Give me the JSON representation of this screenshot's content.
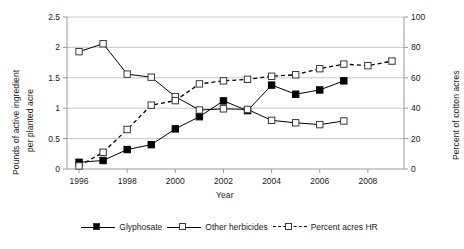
{
  "chart_data": {
    "type": "line",
    "title": "",
    "xlabel": "Year",
    "ylabel": "Pounds of active ingredient per planted acre",
    "ylabel_line1": "Pounds of active ingredient",
    "ylabel_line2": "per planted acre",
    "y2label": "Percent of cotton acres",
    "xlim": [
      1995.5,
      2009.5
    ],
    "ylim": [
      0,
      2.5
    ],
    "y2lim": [
      0,
      100
    ],
    "grid": true,
    "legend_position": "bottom",
    "x": [
      1996,
      1997,
      1998,
      1999,
      2000,
      2001,
      2002,
      2003,
      2004,
      2005,
      2006,
      2007,
      2008,
      2009
    ],
    "xticks": [
      1996,
      1998,
      2000,
      2002,
      2004,
      2006,
      2008
    ],
    "xtick_labels": [
      "1996",
      "1998",
      "2000",
      "2002",
      "2004",
      "2006",
      "2008"
    ],
    "yticks": [
      0,
      0.5,
      1,
      1.5,
      2,
      2.5
    ],
    "ytick_labels": [
      "0",
      "0.5",
      "1",
      "1.5",
      "2",
      "2.5"
    ],
    "y2ticks": [
      0,
      20,
      40,
      60,
      80,
      100
    ],
    "y2tick_labels": [
      "0",
      "20",
      "40",
      "60",
      "80",
      "100"
    ],
    "series": [
      {
        "name": "Glyphosate",
        "axis": "left",
        "marker": "filled-square",
        "line": "solid",
        "x": [
          1996,
          1997,
          1998,
          1999,
          2000,
          2001,
          2002,
          2003,
          2004,
          2005,
          2006,
          2007
        ],
        "values": [
          0.11,
          0.14,
          0.32,
          0.4,
          0.66,
          0.86,
          1.12,
          0.96,
          1.38,
          1.23,
          1.3,
          1.45
        ]
      },
      {
        "name": "Other herbicides",
        "axis": "left",
        "marker": "open-square",
        "line": "solid",
        "x": [
          1996,
          1997,
          1998,
          1999,
          2000,
          2001,
          2002,
          2003,
          2004,
          2005,
          2006,
          2007
        ],
        "values": [
          1.93,
          2.06,
          1.56,
          1.51,
          1.19,
          0.97,
          0.99,
          0.98,
          0.8,
          0.76,
          0.73,
          0.79
        ]
      },
      {
        "name": "Percent acres HR",
        "axis": "right",
        "marker": "open-square",
        "line": "dashed",
        "x": [
          1996,
          1997,
          1998,
          1999,
          2000,
          2001,
          2002,
          2003,
          2004,
          2005,
          2006,
          2007,
          2008,
          2009
        ],
        "values": [
          2,
          11,
          26,
          42,
          45,
          56,
          58,
          59,
          61,
          62,
          66,
          69,
          68,
          71
        ]
      }
    ],
    "legend": [
      "Glyphosate",
      "Other herbicides",
      "Percent acres HR"
    ],
    "colors": {
      "line": "#000000",
      "grid": "#c8c8c8",
      "axis": "#9a9a9a",
      "text": "#1a1a1a",
      "marker_fill": "#000000",
      "marker_open": "#ffffff",
      "marker_edge": "#3a3a3a"
    }
  }
}
